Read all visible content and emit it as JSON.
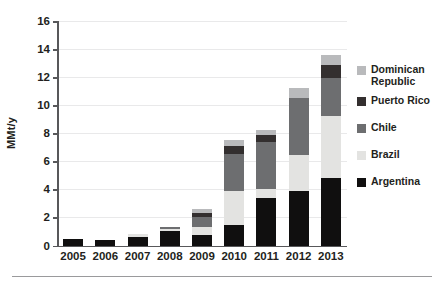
{
  "chart_data": {
    "type": "bar",
    "stacked": true,
    "title": "",
    "subtitle": "",
    "xlabel": "",
    "ylabel": "MMt/y",
    "categories": [
      "2005",
      "2006",
      "2007",
      "2008",
      "2009",
      "2010",
      "2011",
      "2012",
      "2013"
    ],
    "ylim": [
      0,
      16
    ],
    "yticks": [
      0,
      2,
      4,
      6,
      8,
      10,
      12,
      14,
      16
    ],
    "ytick_labels": [
      "0",
      "2",
      "4",
      "6",
      "8",
      "10",
      "12",
      "14",
      "16"
    ],
    "grid": true,
    "grid_axis": "y",
    "legend_position": "right",
    "series": [
      {
        "name": "Argentina",
        "color": "#100f0f",
        "values": [
          0.45,
          0.4,
          0.6,
          1.0,
          0.75,
          1.45,
          3.4,
          3.85,
          4.8
        ]
      },
      {
        "name": "Brazil",
        "color": "#e3e3e1",
        "values": [
          0.0,
          0.0,
          0.25,
          0.2,
          0.55,
          2.45,
          0.6,
          2.6,
          4.4
        ]
      },
      {
        "name": "Chile",
        "color": "#6d6e70",
        "values": [
          0.0,
          0.0,
          0.0,
          0.1,
          0.75,
          2.6,
          3.4,
          4.1,
          2.75
        ]
      },
      {
        "name": "Puerto Rico",
        "color": "#332f2f",
        "values": [
          0.0,
          0.0,
          0.0,
          0.0,
          0.3,
          0.6,
          0.45,
          0.0,
          0.95
        ]
      },
      {
        "name": "Dominican Republic",
        "color": "#b9babc",
        "values": [
          0.0,
          0.0,
          0.0,
          0.0,
          0.25,
          0.4,
          0.4,
          0.65,
          0.7
        ]
      }
    ],
    "totals": [
      0.45,
      0.4,
      0.85,
      1.3,
      2.6,
      7.5,
      8.25,
      11.2,
      13.6
    ]
  },
  "legend": {
    "items": [
      {
        "label": "Dominican\nRepublic",
        "color": "#b9babc"
      },
      {
        "label": "Puerto Rico",
        "color": "#332f2f"
      },
      {
        "label": "Chile",
        "color": "#6d6e70"
      },
      {
        "label": "Brazil",
        "color": "#e3e3e1"
      },
      {
        "label": "Argentina",
        "color": "#100f0f"
      }
    ]
  },
  "colors": {
    "axis": "#58585a",
    "grid": "#e9e9ea",
    "text": "#231f20",
    "rule": "#9a9a9c",
    "background": "#ffffff"
  }
}
